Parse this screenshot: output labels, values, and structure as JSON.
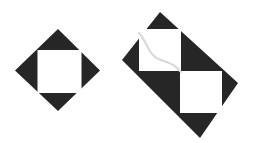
{
  "canvas": {
    "width": 256,
    "height": 143,
    "background_color": "#ffffff",
    "title": "",
    "description": "Two black geometric tile figures on a white background: a left diamond with a white square inset, and a right rotated rectangle with two white squares in a checkerboard arrangement"
  },
  "palette": {
    "ink": "#262626",
    "paper": "#ffffff",
    "curve_stroke": "#d9d9d9"
  },
  "figures": [
    {
      "id": "left-diamond-tile",
      "label": "Diamond with inset white square",
      "shape": "diamond",
      "fill_color": "#262626",
      "center": {
        "x": 58,
        "y": 70
      },
      "vertices": [
        {
          "x": 58,
          "y": 29
        },
        {
          "x": 100,
          "y": 70.5
        },
        {
          "x": 58,
          "y": 111
        },
        {
          "x": 15,
          "y": 70.5
        }
      ],
      "inner_squares": [
        {
          "id": "left-inner-square",
          "label": "White square inset",
          "fill_color": "#ffffff",
          "x": 37.5,
          "y": 50,
          "width": 44,
          "height": 43
        }
      ]
    },
    {
      "id": "right-rectangle-tile",
      "label": "Rotated rectangle with two white squares",
      "shape": "rotated-rectangle",
      "fill_color": "#262626",
      "rotation_degrees": 44,
      "vertices": [
        {
          "x": 160,
          "y": 12
        },
        {
          "x": 238,
          "y": 83
        },
        {
          "x": 200,
          "y": 138
        },
        {
          "x": 122,
          "y": 60
        }
      ],
      "inner_squares": [
        {
          "id": "right-inner-square-upper-left",
          "label": "Upper-left white square",
          "fill_color": "#ffffff",
          "x": 139,
          "y": 29,
          "width": 42,
          "height": 42
        },
        {
          "id": "right-inner-square-lower-right",
          "label": "Lower-right white square",
          "fill_color": "#ffffff",
          "x": 180,
          "y": 71,
          "width": 42,
          "height": 42
        }
      ],
      "annotation_curve": {
        "id": "sigmoid-curve",
        "label": "Faint S-shaped curve",
        "stroke_color": "#d9d9d9",
        "stroke_width": 2.2,
        "path": "M 139 33 C 147 41, 148 56, 161 60 C 173 64, 176 66, 181 72"
      }
    }
  ]
}
